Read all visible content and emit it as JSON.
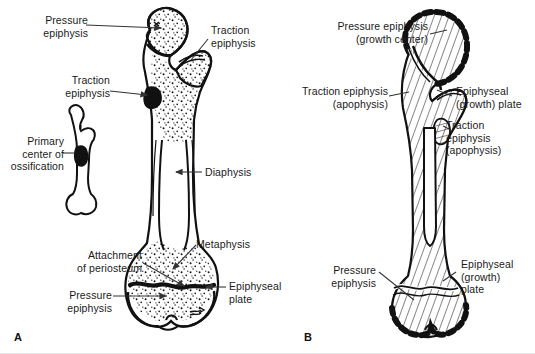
{
  "figure": {
    "background_color": "#ffffff",
    "ink_color": "#111111"
  },
  "panel_a": {
    "letter": "A",
    "description": "Line drawing of a growing femur with stippled cancellous bone, plus an inset fetal bone showing the primary center of ossification",
    "labels": [
      {
        "id": "pressure-epiphysis-proximal",
        "text": "Pressure\nepiphysis",
        "align": "right",
        "x": 22,
        "y": 14
      },
      {
        "id": "traction-epiphysis-greater-trochanter",
        "text": "Traction\nepiphysis",
        "align": "left",
        "x": 211,
        "y": 24
      },
      {
        "id": "traction-epiphysis-lesser-trochanter",
        "text": "Traction\nepiphysis",
        "align": "right",
        "x": 60,
        "y": 74
      },
      {
        "id": "primary-center-of-ossification",
        "text": "Primary\ncenter of\nossification",
        "align": "right",
        "x": 18,
        "y": 135
      },
      {
        "id": "diaphysis",
        "text": "Diaphysis",
        "align": "left",
        "x": 205,
        "y": 167
      },
      {
        "id": "metaphysis",
        "text": "Metaphysis",
        "align": "left",
        "x": 196,
        "y": 238
      },
      {
        "id": "attachment-of-periosteum",
        "text": "Attachment\nof periosteum",
        "align": "right",
        "x": 42,
        "y": 249
      },
      {
        "id": "epiphyseal-plate",
        "text": "Epiphyseal\nplate",
        "align": "left",
        "x": 229,
        "y": 279
      },
      {
        "id": "pressure-epiphysis-distal",
        "text": "Pressure\nepiphysis",
        "align": "right",
        "x": 50,
        "y": 289
      }
    ]
  },
  "panel_b": {
    "letter": "B",
    "description": "Hatched schematic of the same femur with thick black dashed epiphyseal rims marking growth centers",
    "labels": [
      {
        "id": "pressure-epiphysis-growth-center",
        "text": "Pressure epiphysis\n(growth center)",
        "align": "right",
        "x": 283,
        "y": 20
      },
      {
        "id": "traction-epiphysis-apophysis-upper",
        "text": "Traction epiphysis\n(apophysis)",
        "align": "right",
        "x": 287,
        "y": 85
      },
      {
        "id": "epiphyseal-growth-plate-proximal",
        "text": "Epiphyseal\n(growth) plate",
        "align": "left",
        "x": 455,
        "y": 85
      },
      {
        "id": "traction-epiphysis-apophysis-lower",
        "text": "Traction\nepiphysis\n(apophysis)",
        "align": "left",
        "x": 446,
        "y": 119
      },
      {
        "id": "pressure-epiphysis-distal-b",
        "text": "Pressure\nepiphysis",
        "align": "right",
        "x": 316,
        "y": 264
      },
      {
        "id": "epiphyseal-growth-plate-distal",
        "text": "Epiphyseal\n(growth)\nplate",
        "align": "left",
        "x": 460,
        "y": 258
      }
    ]
  }
}
